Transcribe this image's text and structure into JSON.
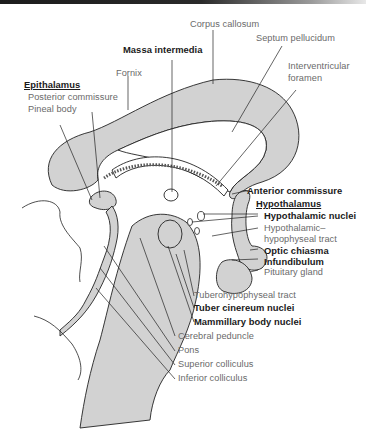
{
  "diagram": {
    "colors": {
      "fill": "#d2d2d2",
      "stroke": "#222222",
      "label_light": "#6a6a6a",
      "label_bold": "#1a1a1a"
    },
    "labels": {
      "corpus_callosum": "Corpus callosum",
      "septum_pellucidum": "Septum pellucidum",
      "massa_intermedia": "Massa intermedia",
      "interventricular_1": "Interventricular",
      "interventricular_2": "foramen",
      "fornix": "Fornix",
      "epithalamus": "Epithalamus",
      "posterior_commissure": "Posterior commissure",
      "pineal_body": "Pineal body",
      "anterior_commissure": "Anterior commissure",
      "hypothalamus": "Hypothalamus",
      "hypothalamic_nuclei": "Hypothalamic nuclei",
      "hh_tract_1": "Hypothalamic–",
      "hh_tract_2": "hypophyseal tract",
      "optic_chiasma": "Optic chiasma",
      "infundibulum": "Infundibulum",
      "pituitary_gland": "Pituitary gland",
      "tuberohypophyseal_tract": "Tuberohypophyseal tract",
      "tuber_cinereum_nuclei": "Tuber cinereum nuclei",
      "mammillary_body_nuclei": "Mammillary body nuclei",
      "cerebral_peduncle": "Cerebral peduncle",
      "pons": "Pons",
      "superior_colliculus": "Superior colliculus",
      "inferior_colliculus": "Inferior colliculus"
    }
  }
}
